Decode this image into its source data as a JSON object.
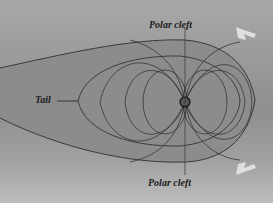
{
  "diagram": {
    "labels": {
      "polar_cleft_top": "Polar cleft",
      "polar_cleft_bottom": "Polar cleft",
      "tail": "Tail"
    },
    "icons": {
      "solar_wind_arrow_top": "arrow-left-down",
      "solar_wind_arrow_bottom": "arrow-left-up"
    },
    "colors": {
      "background": "#9a9a9a",
      "field_lines": "#2a2a2a",
      "arrows": "#e8e8e8"
    }
  }
}
